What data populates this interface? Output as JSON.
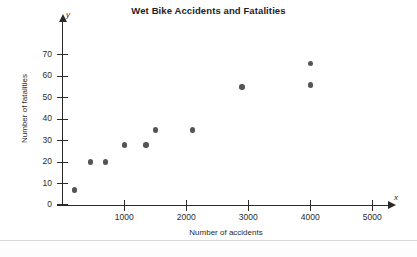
{
  "chart_data": {
    "type": "scatter",
    "title": "Wet Bike Accidents and Fatalities",
    "xlabel": "Number of accidents",
    "ylabel": "Number of fatalities",
    "x_axis_symbol": "x",
    "y_axis_symbol": "y",
    "xlim": [
      0,
      5400
    ],
    "ylim": [
      0,
      74
    ],
    "xticks": [
      1000,
      2000,
      3000,
      4000,
      5000
    ],
    "xtick_labels": [
      "1000",
      "2000",
      "3000",
      "4000",
      "5000"
    ],
    "yticks": [
      0,
      10,
      20,
      30,
      40,
      50,
      60,
      70
    ],
    "ytick_labels": [
      "0",
      "10",
      "20",
      "30",
      "40",
      "50",
      "60",
      "70"
    ],
    "grid": false,
    "legend": false,
    "marker_color": "#555555",
    "axis_color": "#2a2a2a",
    "points": [
      {
        "x": 200,
        "y": 7
      },
      {
        "x": 450,
        "y": 20
      },
      {
        "x": 700,
        "y": 20
      },
      {
        "x": 1000,
        "y": 28
      },
      {
        "x": 1350,
        "y": 28
      },
      {
        "x": 1500,
        "y": 35
      },
      {
        "x": 2100,
        "y": 35
      },
      {
        "x": 2900,
        "y": 55
      },
      {
        "x": 4000,
        "y": 56
      },
      {
        "x": 4000,
        "y": 66
      }
    ]
  }
}
